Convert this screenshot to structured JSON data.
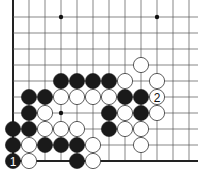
{
  "board": {
    "grid": {
      "origin_x": 13,
      "origin_y": 17,
      "spacing": 16,
      "cols": 12,
      "rows": 10
    },
    "edges": {
      "left": true,
      "bottom": true
    },
    "colors": {
      "black": "#1a1a1a",
      "white": "#ffffff",
      "line": "#555555",
      "edge": "#222222"
    },
    "star_points": [
      [
        3,
        0
      ],
      [
        9,
        0
      ],
      [
        3,
        6
      ]
    ],
    "stones": [
      {
        "c": 8,
        "r": 3,
        "color": "white"
      },
      {
        "c": 3,
        "r": 4,
        "color": "black"
      },
      {
        "c": 4,
        "r": 4,
        "color": "black"
      },
      {
        "c": 5,
        "r": 4,
        "color": "black"
      },
      {
        "c": 6,
        "r": 4,
        "color": "black"
      },
      {
        "c": 7,
        "r": 4,
        "color": "white"
      },
      {
        "c": 9,
        "r": 4,
        "color": "white"
      },
      {
        "c": 1,
        "r": 5,
        "color": "black"
      },
      {
        "c": 2,
        "r": 5,
        "color": "black"
      },
      {
        "c": 3,
        "r": 5,
        "color": "white"
      },
      {
        "c": 4,
        "r": 5,
        "color": "white"
      },
      {
        "c": 5,
        "r": 5,
        "color": "white"
      },
      {
        "c": 6,
        "r": 5,
        "color": "white"
      },
      {
        "c": 7,
        "r": 5,
        "color": "black"
      },
      {
        "c": 8,
        "r": 5,
        "color": "black"
      },
      {
        "c": 9,
        "r": 5,
        "color": "white",
        "label": "2"
      },
      {
        "c": 1,
        "r": 6,
        "color": "black"
      },
      {
        "c": 2,
        "r": 6,
        "color": "white"
      },
      {
        "c": 6,
        "r": 6,
        "color": "black"
      },
      {
        "c": 7,
        "r": 6,
        "color": "white"
      },
      {
        "c": 8,
        "r": 6,
        "color": "black"
      },
      {
        "c": 9,
        "r": 6,
        "color": "white"
      },
      {
        "c": 0,
        "r": 7,
        "color": "black"
      },
      {
        "c": 1,
        "r": 7,
        "color": "black"
      },
      {
        "c": 2,
        "r": 7,
        "color": "white"
      },
      {
        "c": 3,
        "r": 7,
        "color": "white"
      },
      {
        "c": 4,
        "r": 7,
        "color": "white"
      },
      {
        "c": 6,
        "r": 7,
        "color": "black"
      },
      {
        "c": 7,
        "r": 7,
        "color": "white"
      },
      {
        "c": 8,
        "r": 7,
        "color": "white"
      },
      {
        "c": 0,
        "r": 8,
        "color": "black"
      },
      {
        "c": 1,
        "r": 8,
        "color": "white"
      },
      {
        "c": 2,
        "r": 8,
        "color": "black"
      },
      {
        "c": 3,
        "r": 8,
        "color": "black"
      },
      {
        "c": 4,
        "r": 8,
        "color": "black"
      },
      {
        "c": 5,
        "r": 8,
        "color": "white"
      },
      {
        "c": 8,
        "r": 8,
        "color": "white"
      },
      {
        "c": 0,
        "r": 9,
        "color": "black",
        "label": "1"
      },
      {
        "c": 1,
        "r": 9,
        "color": "white"
      },
      {
        "c": 4,
        "r": 9,
        "color": "black"
      },
      {
        "c": 5,
        "r": 9,
        "color": "white"
      }
    ]
  }
}
